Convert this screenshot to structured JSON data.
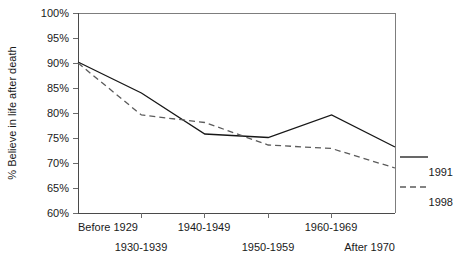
{
  "chart_data": {
    "type": "line",
    "title": "",
    "subtitle": "",
    "xlabel": "",
    "ylabel": "% Believe in life after death",
    "categories": [
      "Before 1929",
      "1930-1939",
      "1940-1949",
      "1950-1959",
      "1960-1969",
      "After 1970"
    ],
    "ytick_labels": [
      "100%",
      "95%",
      "90%",
      "85%",
      "80%",
      "75%",
      "70%",
      "65%",
      "60%"
    ],
    "ytick_values": [
      100,
      95,
      90,
      85,
      80,
      75,
      70,
      65,
      60
    ],
    "ylim": [
      60,
      100
    ],
    "grid": false,
    "legend_position": "right-outside",
    "series": [
      {
        "name": "1991",
        "style": "solid",
        "color": "#171717",
        "values": [
          90.2,
          84.0,
          75.8,
          75.1,
          79.6,
          73.2
        ]
      },
      {
        "name": "1998",
        "style": "dashed",
        "color": "#5b5b5b",
        "values": [
          90.0,
          79.6,
          78.1,
          73.6,
          72.9,
          69.0
        ]
      }
    ]
  },
  "legend": {
    "entries": [
      {
        "label": "1991",
        "marker": "solid-line-swatch"
      },
      {
        "label": "1998",
        "marker": "dashed-line-swatch"
      }
    ]
  }
}
